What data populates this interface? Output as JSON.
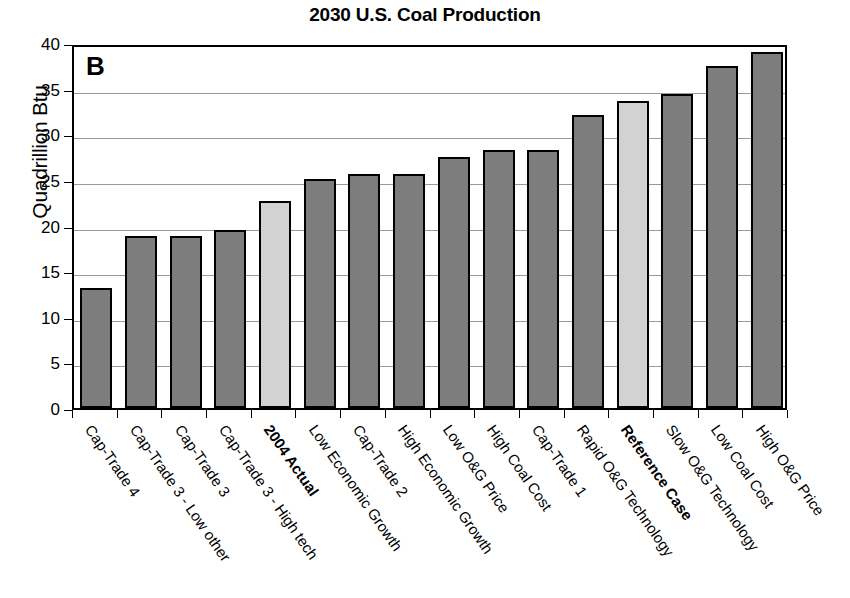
{
  "chart_data": {
    "type": "bar",
    "title": "2030 U.S. Coal Production",
    "panel_label": "B",
    "xlabel": "",
    "ylabel": "Quadrillion Btu",
    "ylim": [
      0,
      40
    ],
    "yticks": [
      0,
      5,
      10,
      15,
      20,
      25,
      30,
      35,
      40
    ],
    "grid": true,
    "legend": "none",
    "colors": {
      "bar_default": "#7d7d7d",
      "bar_highlight": "#d2d2d2",
      "bar_outline": "#000000",
      "gridline": "#9a9a9a",
      "axis": "#000000",
      "background": "#ffffff"
    },
    "categories": [
      "Cap-Trade 4",
      "Cap-Trade 3 - Low other",
      "Cap-Trade 3",
      "Cap-Trade 3 - High tech",
      "2004 Actual",
      "Low Economic Growth",
      "Cap-Trade 2",
      "High Economic Growth",
      "Low O&G Price",
      "High Coal Cost",
      "Cap-Trade 1",
      "Rapid O&G Technology",
      "Reference Case",
      "Slow O&G Technology",
      "Low Coal Cost",
      "High O&G Price"
    ],
    "values": [
      13.1,
      18.9,
      18.9,
      19.5,
      22.7,
      25.1,
      25.7,
      25.7,
      27.5,
      28.3,
      28.3,
      32.1,
      33.6,
      34.4,
      37.5,
      39.0
    ],
    "bar_styles": [
      "default",
      "default",
      "default",
      "default",
      "highlight",
      "default",
      "default",
      "default",
      "default",
      "default",
      "default",
      "default",
      "highlight",
      "default",
      "default",
      "default"
    ],
    "label_styles": [
      "normal",
      "normal",
      "normal",
      "normal",
      "bold",
      "normal",
      "normal",
      "normal",
      "normal",
      "normal",
      "normal",
      "normal",
      "bold",
      "normal",
      "normal",
      "normal"
    ]
  }
}
